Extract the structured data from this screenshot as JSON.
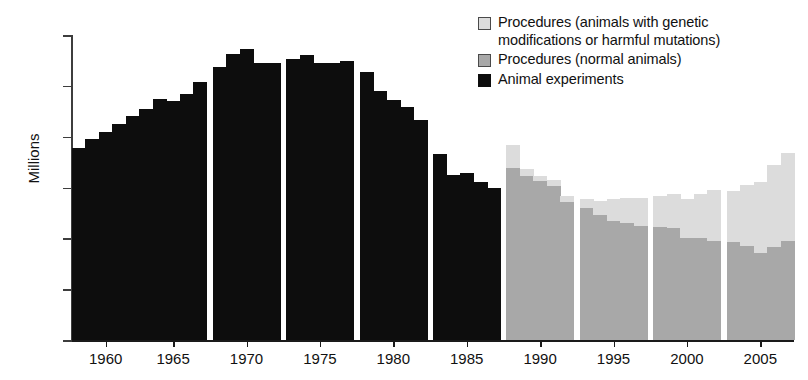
{
  "chart_data": {
    "type": "bar",
    "stacked": true,
    "title": "",
    "xlabel": "",
    "ylabel": "Millions",
    "ylim": [
      0,
      6
    ],
    "yticks": [
      0,
      1,
      2,
      3,
      4,
      5,
      6
    ],
    "xticks": [
      1960,
      1965,
      1970,
      1975,
      1980,
      1985,
      1990,
      1995,
      2000,
      2005
    ],
    "grid": false,
    "legend_position": "top-right",
    "colors": {
      "animal_experiments": "#0d0d0d",
      "procedures_normal": "#a8a8a8",
      "procedures_genetic": "#dcdcdc",
      "axis": "#1a1a1a",
      "background": "#ffffff"
    },
    "legend": [
      "Procedures (animals with genetic\nmodifications or harmful mutations)",
      "Procedures (normal animals)",
      "Animal experiments"
    ],
    "x": [
      1958,
      1959,
      1960,
      1961,
      1962,
      1963,
      1964,
      1965,
      1966,
      1967,
      1968,
      1969,
      1970,
      1971,
      1972,
      1973,
      1974,
      1975,
      1976,
      1977,
      1978,
      1979,
      1980,
      1981,
      1982,
      1983,
      1984,
      1985,
      1986,
      1987,
      1988,
      1989,
      1990,
      1991,
      1992,
      1993,
      1994,
      1995,
      1996,
      1997,
      1998,
      1999,
      2000,
      2001,
      2002,
      2003,
      2004,
      2005,
      2006,
      2007
    ],
    "series": [
      {
        "name": "Animal experiments",
        "color": "#0d0d0d",
        "values": [
          3.78,
          3.95,
          4.1,
          4.25,
          4.4,
          4.55,
          4.75,
          4.7,
          4.83,
          5.08,
          5.38,
          5.62,
          5.72,
          5.45,
          5.45,
          5.52,
          5.6,
          5.45,
          5.45,
          5.48,
          5.28,
          4.9,
          4.72,
          4.58,
          4.32,
          3.65,
          3.25,
          3.28,
          3.1,
          3.0,
          null,
          null,
          null,
          null,
          null,
          null,
          null,
          null,
          null,
          null,
          null,
          null,
          null,
          null,
          null,
          null,
          null,
          null,
          null,
          null
        ]
      },
      {
        "name": "Procedures (normal animals)",
        "color": "#a8a8a8",
        "values": [
          null,
          null,
          null,
          null,
          null,
          null,
          null,
          null,
          null,
          null,
          null,
          null,
          null,
          null,
          null,
          null,
          null,
          null,
          null,
          null,
          null,
          null,
          null,
          null,
          null,
          null,
          null,
          null,
          null,
          null,
          3.38,
          3.22,
          3.12,
          3.02,
          2.72,
          2.6,
          2.45,
          2.35,
          2.3,
          2.25,
          2.22,
          2.2,
          2.0,
          2.0,
          1.95,
          1.92,
          1.85,
          1.72,
          1.82,
          1.95
        ]
      },
      {
        "name": "Procedures (animals with genetic modifications or harmful mutations)",
        "color": "#dcdcdc",
        "values": [
          null,
          null,
          null,
          null,
          null,
          null,
          null,
          null,
          null,
          null,
          null,
          null,
          null,
          null,
          null,
          null,
          null,
          null,
          null,
          null,
          null,
          null,
          null,
          null,
          null,
          null,
          null,
          null,
          null,
          null,
          0.45,
          0.15,
          0.1,
          0.12,
          0.12,
          0.18,
          0.28,
          0.42,
          0.5,
          0.55,
          0.62,
          0.68,
          0.78,
          0.88,
          1.0,
          1.02,
          1.2,
          1.38,
          1.62,
          1.72
        ]
      }
    ],
    "totals": [
      3.78,
      3.95,
      4.1,
      4.25,
      4.4,
      4.55,
      4.75,
      4.7,
      4.83,
      5.08,
      5.38,
      5.62,
      5.72,
      5.45,
      5.45,
      5.52,
      5.6,
      5.45,
      5.45,
      5.48,
      5.28,
      4.9,
      4.72,
      4.58,
      4.32,
      3.65,
      3.25,
      3.28,
      3.1,
      3.0,
      3.83,
      3.37,
      3.22,
      3.14,
      2.84,
      2.78,
      2.73,
      2.77,
      2.8,
      2.8,
      2.84,
      2.88,
      2.78,
      2.88,
      2.95,
      2.94,
      3.05,
      3.1,
      3.44,
      3.67
    ],
    "group_gaps_after": [
      1967,
      1972,
      1977,
      1982,
      1987,
      1992,
      1997,
      2002
    ]
  },
  "axis": {
    "ylabel": "Millions",
    "ytick_labels": [
      "0",
      "1",
      "2",
      "3",
      "4",
      "5",
      "6"
    ],
    "xtick_labels": [
      "1960",
      "1965",
      "1970",
      "1975",
      "1980",
      "1985",
      "1990",
      "1995",
      "2000",
      "2005"
    ]
  },
  "legend": {
    "items": [
      {
        "swatch": "light-gray-swatch",
        "label": "Procedures (animals with genetic\nmodifications or harmful mutations)"
      },
      {
        "swatch": "medium-gray-swatch",
        "label": "Procedures (normal animals)"
      },
      {
        "swatch": "black-swatch",
        "label": "Animal experiments"
      }
    ]
  }
}
